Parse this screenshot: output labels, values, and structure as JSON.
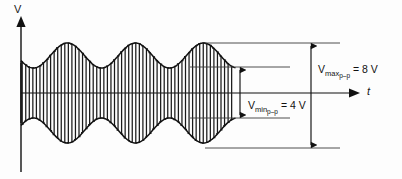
{
  "figure": {
    "axes": {
      "y_label": "V",
      "x_label": "t",
      "y_axis_name": "voltage-axis",
      "x_axis_name": "time-axis"
    },
    "annotations": [
      {
        "id": "vmax",
        "symbol": "V",
        "sub_main": "max",
        "sub_sub": "p–p",
        "equals": " = 8 V",
        "value": 8,
        "unit": "V",
        "full_text": "Vmaxp–p = 8 V"
      },
      {
        "id": "vmin",
        "symbol": "V",
        "sub_main": "min",
        "sub_sub": "p–p",
        "equals": " = 4 V",
        "value": 4,
        "unit": "V",
        "full_text": "Vminp–p = 4 V"
      }
    ],
    "colors": {
      "stroke": "#111111",
      "thin_stroke": "#3a3a3a",
      "background": "#fdfdfd"
    }
  },
  "chart_data": {
    "type": "line",
    "xlabel": "t",
    "ylabel": "V",
    "grid": false,
    "legend": null,
    "axis_origin_px": {
      "x": 21,
      "y": 93
    },
    "signal": {
      "carrier_cycles_visible": 60,
      "envelope_peaks": 3,
      "envelope_period_px": 68,
      "envelope_max_amplitude": 4,
      "envelope_min_amplitude": 2,
      "modulation_index": 0.3333
    },
    "measurements": [
      {
        "name": "V_max_p-p",
        "value": 8,
        "unit": "V"
      },
      {
        "name": "V_min_p-p",
        "value": 4,
        "unit": "V"
      }
    ],
    "reference_lines_px": [
      43,
      67,
      118,
      148
    ],
    "ylim": [
      -4.6,
      4.6
    ],
    "xlim": [
      0,
      215
    ]
  }
}
